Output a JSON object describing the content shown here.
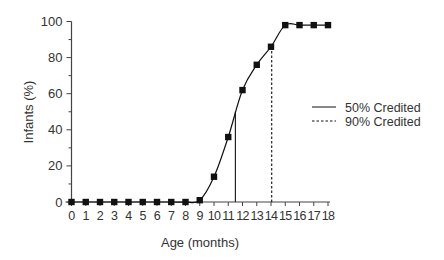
{
  "chart_data": {
    "type": "line",
    "title": "",
    "xlabel": "Age (months)",
    "ylabel": "Infants (%)",
    "x": [
      0,
      1,
      2,
      3,
      4,
      5,
      6,
      7,
      8,
      9,
      10,
      11,
      12,
      13,
      14,
      15,
      16,
      17,
      18
    ],
    "series": [
      {
        "name": "Infants (%)",
        "values": [
          0,
          0,
          0,
          0,
          0,
          0,
          0,
          0,
          0,
          1,
          14,
          36,
          62,
          76,
          86,
          98,
          98,
          98,
          98
        ],
        "marker": "square"
      }
    ],
    "reference_lines": [
      {
        "name": "50% Credited",
        "x": 11.5,
        "y_to": 50,
        "style": "solid"
      },
      {
        "name": "90% Credited",
        "x": 14.05,
        "y_to": 86,
        "style": "dashed"
      }
    ],
    "xlim": [
      0,
      18
    ],
    "ylim": [
      0,
      100
    ],
    "xticks": [
      "0",
      "1",
      "2",
      "3",
      "4",
      "5",
      "6",
      "7",
      "8",
      "9",
      "10",
      "11",
      "12",
      "13",
      "14",
      "15",
      "16",
      "17",
      "18"
    ],
    "yticks": [
      "0",
      "20",
      "40",
      "60",
      "80",
      "100"
    ],
    "y_minor_ticks": [
      10,
      30,
      50,
      70,
      90
    ],
    "grid": false,
    "legend": {
      "position": "right",
      "entries": [
        "50% Credited",
        "90% Credited"
      ]
    }
  },
  "colors": {
    "line": "#111111",
    "axis": "#444444",
    "text": "#333333"
  }
}
